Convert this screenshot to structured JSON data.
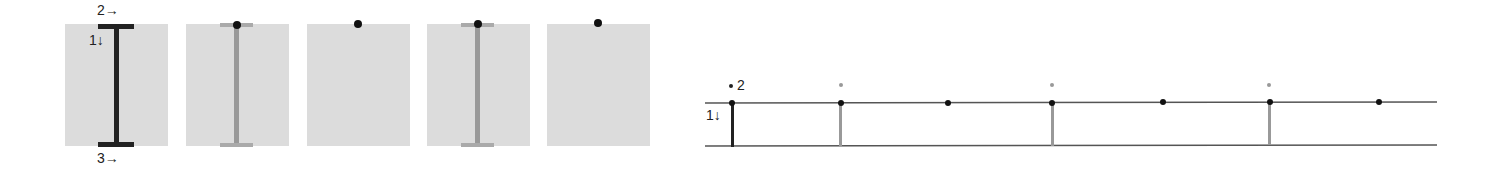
{
  "left_sequence": {
    "panels": [
      {
        "id": 1,
        "bar": "dark",
        "labels": {
          "top": "2→",
          "side": "1↓",
          "bottom": "3→"
        }
      },
      {
        "id": 2,
        "bar": "faded",
        "dot": true
      },
      {
        "id": 3,
        "bar": "none",
        "dot": true
      },
      {
        "id": 4,
        "bar": "faded",
        "dot": true
      },
      {
        "id": 5,
        "bar": "none",
        "dot": true
      }
    ]
  },
  "right_diagram": {
    "labels": {
      "top": "2",
      "side": "1↓"
    },
    "colors": {
      "line": "#555555",
      "dark": "#222222",
      "faded": "#999999"
    }
  }
}
